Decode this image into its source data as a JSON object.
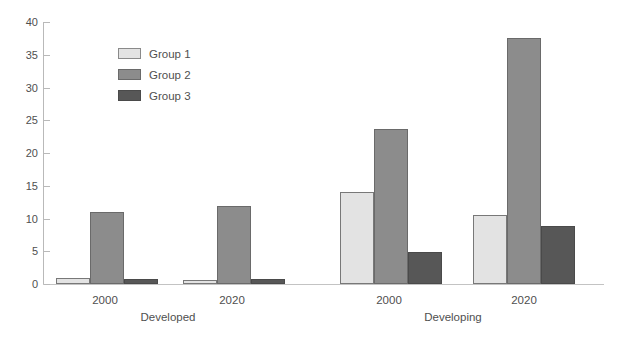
{
  "chart_data": {
    "type": "bar",
    "title": "",
    "subtitle": "",
    "xlabel": "",
    "ylabel": "",
    "ylim": [
      0,
      40
    ],
    "yticks": [
      0,
      5,
      10,
      15,
      20,
      25,
      30,
      35,
      40
    ],
    "ytick_labels": [
      "0",
      "5",
      "10",
      "15",
      "20",
      "25",
      "30",
      "35",
      "40"
    ],
    "grid": false,
    "legend_position": "upper-left-inside",
    "legend_entries": [
      "Group 1",
      "Group 2",
      "Group 3"
    ],
    "group_labels": [
      "Developed",
      "Developing"
    ],
    "categories": [
      "2000",
      "2020",
      "2000",
      "2020"
    ],
    "category_groups": [
      "Developed",
      "Developed",
      "Developing",
      "Developing"
    ],
    "series": [
      {
        "name": "Group 1",
        "color": "#e3e3e3",
        "values": [
          0.9,
          0.6,
          14.0,
          10.5
        ]
      },
      {
        "name": "Group 2",
        "color": "#8c8c8c",
        "values": [
          11.0,
          11.9,
          23.7,
          37.5
        ]
      },
      {
        "name": "Group 3",
        "color": "#575757",
        "values": [
          0.8,
          0.8,
          4.9,
          8.9
        ]
      }
    ]
  },
  "axis": {
    "y_ticks": [
      {
        "label": "40",
        "value": 40
      },
      {
        "label": "35",
        "value": 35
      },
      {
        "label": "30",
        "value": 30
      },
      {
        "label": "25",
        "value": 25
      },
      {
        "label": "20",
        "value": 20
      },
      {
        "label": "15",
        "value": 15
      },
      {
        "label": "10",
        "value": 10
      },
      {
        "label": "5",
        "value": 5
      },
      {
        "label": "0",
        "value": 0
      }
    ]
  },
  "legend": {
    "items": [
      {
        "label": "Group 1",
        "swatch": "g1"
      },
      {
        "label": "Group 2",
        "swatch": "g2"
      },
      {
        "label": "Group 3",
        "swatch": "g3"
      }
    ]
  },
  "x_axis": {
    "cluster_labels": [
      "2000",
      "2020",
      "2000",
      "2020"
    ],
    "group_labels": [
      "Developed",
      "Developing"
    ]
  },
  "caption": {
    "clipped_text": ""
  }
}
